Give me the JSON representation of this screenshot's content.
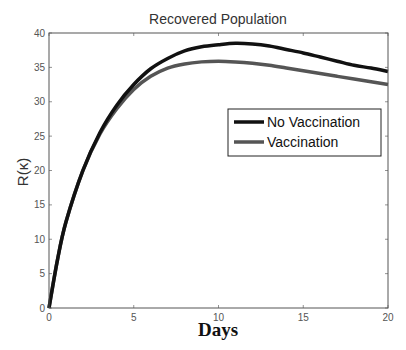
{
  "chart_data": {
    "type": "line",
    "title": "Recovered Population",
    "xlabel": "Days",
    "ylabel": "R(κ)",
    "xlim": [
      0,
      20
    ],
    "ylim": [
      0,
      40
    ],
    "xticks": [
      0,
      5,
      10,
      15,
      20
    ],
    "yticks": [
      0,
      5,
      10,
      15,
      20,
      25,
      30,
      35,
      40
    ],
    "grid": false,
    "legend_position": "upper right (inside, middle-right)",
    "x": [
      0,
      0.5,
      1,
      2,
      3,
      4,
      5,
      6,
      7,
      8,
      9,
      10,
      11,
      12,
      13,
      14,
      15,
      16,
      17,
      18,
      19,
      20
    ],
    "series": [
      {
        "name": "No Vaccination",
        "color": "#111111",
        "values": [
          0,
          7,
          12.5,
          20,
          25.5,
          29.5,
          32.5,
          34.8,
          36.3,
          37.4,
          38.0,
          38.3,
          38.5,
          38.4,
          38.1,
          37.6,
          37.1,
          36.5,
          35.9,
          35.3,
          34.9,
          34.4
        ]
      },
      {
        "name": "Vaccination",
        "color": "#555555",
        "values": [
          0,
          7,
          12.5,
          20,
          25.3,
          29.0,
          31.8,
          33.7,
          34.9,
          35.5,
          35.8,
          35.9,
          35.8,
          35.6,
          35.3,
          34.9,
          34.5,
          34.1,
          33.7,
          33.3,
          32.9,
          32.5
        ]
      }
    ]
  }
}
